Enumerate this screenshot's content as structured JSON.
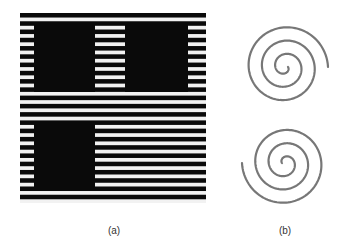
{
  "figure": {
    "panels": [
      {
        "id": "a",
        "caption": "(a)",
        "description": "Horizontal black and white stripe grating with three solid black squares",
        "stripe_color": "#0a0a0a",
        "background_color": "#f2f2f2",
        "stripe_count": 23,
        "squares": [
          {
            "position": "top-left"
          },
          {
            "position": "top-right"
          },
          {
            "position": "bottom-left"
          }
        ]
      },
      {
        "id": "b",
        "caption": "(b)",
        "description": "Double spiral (S-shaped) line drawing",
        "line_color": "#777777"
      }
    ]
  }
}
